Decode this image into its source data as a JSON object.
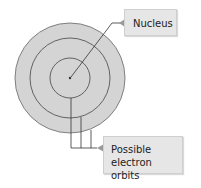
{
  "diagram": {
    "type": "atom-orbit-model",
    "labels": {
      "nucleus": "Nucleus",
      "orbits_line1": "Possible",
      "orbits_line2": "electron orbits"
    },
    "colors": {
      "disc_fill": "#d4d4d4",
      "orbit_stroke": "#555555",
      "leader_line": "#333333",
      "label_bg": "#e6e6e6",
      "label_pointer": "#9a9a9a"
    },
    "orbits": [
      {
        "name": "inner",
        "radius": 20
      },
      {
        "name": "middle",
        "radius": 40
      },
      {
        "name": "outer",
        "radius": 55
      }
    ]
  }
}
